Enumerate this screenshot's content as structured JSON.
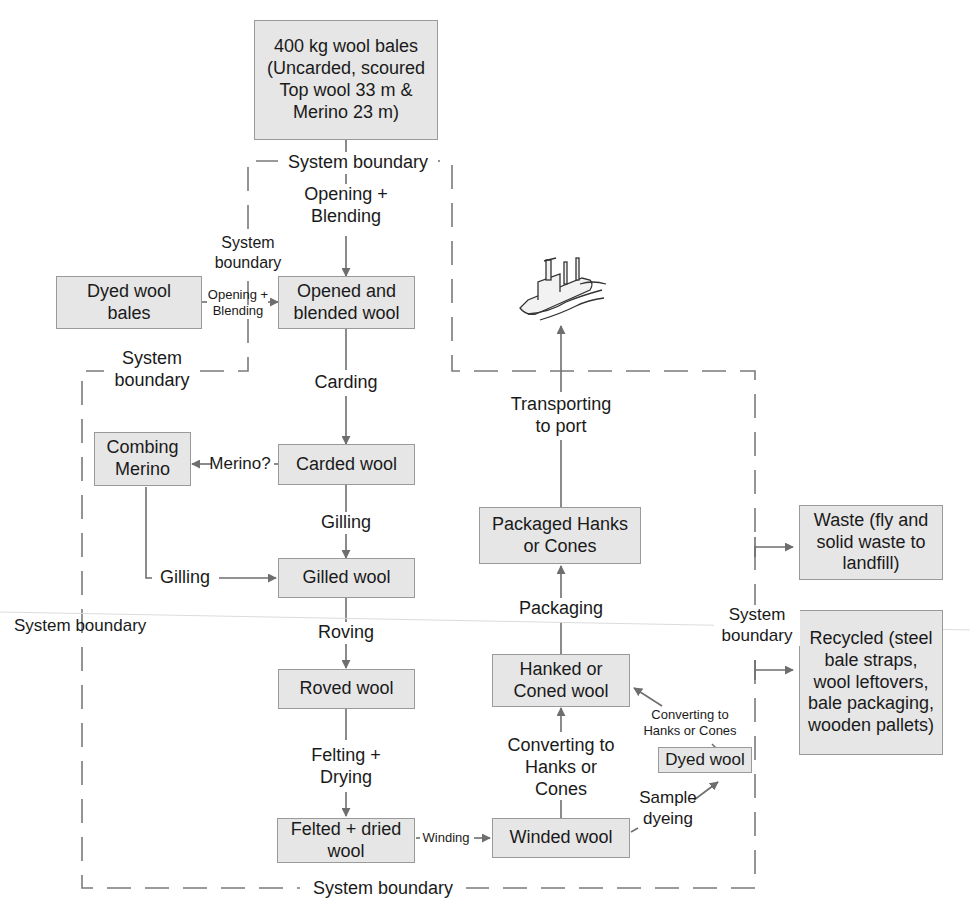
{
  "colors": {
    "box_fill": "#e6e6e6",
    "box_border": "#9a9a9a",
    "line": "#707070",
    "boundary": "#7a7a7a",
    "text": "#1a1a1a"
  },
  "nodes": {
    "wool_bales": "400 kg wool bales\n(Uncarded, scoured\nTop wool 33 m &\nMerino 23 m)",
    "dyed_wool_bales": "Dyed wool\nbales",
    "opened_blended": "Opened and\nblended wool",
    "carded_wool": "Carded wool",
    "combing_merino": "Combing\nMerino",
    "gilled_wool": "Gilled wool",
    "roved_wool": "Roved wool",
    "felted_dried": "Felted + dried\nwool",
    "winded_wool": "Winded wool",
    "dyed_wool": "Dyed wool",
    "hanked_coned": "Hanked or\nConed wool",
    "packaged": "Packaged Hanks\nor Cones",
    "waste": "Waste (fly and\nsolid waste to\nlandfill)",
    "recycled": "Recycled (steel\nbale straps,\nwool leftovers,\nbale packaging,\nwooden pallets)"
  },
  "edges": {
    "opening_blending_main": "Opening +\nBlending",
    "opening_blending_dyed": "Opening +\nBlending",
    "carding": "Carding",
    "merino_question": "Merino?",
    "gilling_main": "Gilling",
    "gilling_merino": "Gilling",
    "roving": "Roving",
    "felting_drying": "Felting +\nDrying",
    "winding": "Winding",
    "sample_dyeing": "Sample\ndyeing",
    "converting_main": "Converting to\nHanks or\nCones",
    "converting_dyed": "Converting to\nHanks or Cones",
    "packaging": "Packaging",
    "transporting": "Transporting\nto port"
  },
  "boundaries": {
    "top": "System boundary",
    "inner_left": "System\nboundary",
    "left_mid": "System\nboundary",
    "far_left": "System boundary",
    "right": "System\nboundary",
    "bottom": "System boundary"
  },
  "icons": {
    "ship": "ship-icon"
  }
}
